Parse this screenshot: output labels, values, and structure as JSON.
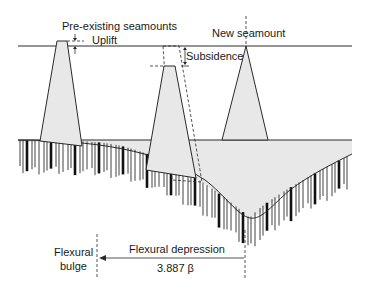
{
  "labels": {
    "pre_existing": "Pre-existing seamounts",
    "uplift": "Uplift",
    "subsidence": "Subsidence",
    "new_seamount": "New seamount",
    "flexural_bulge_line1": "Flexural",
    "flexural_bulge_line2": "bulge",
    "flexural_depression": "Flexural depression",
    "distance": "3.887 β"
  },
  "colors": {
    "fill": "#e8e8e8",
    "line": "#2a2a2a",
    "background": "#ffffff"
  }
}
